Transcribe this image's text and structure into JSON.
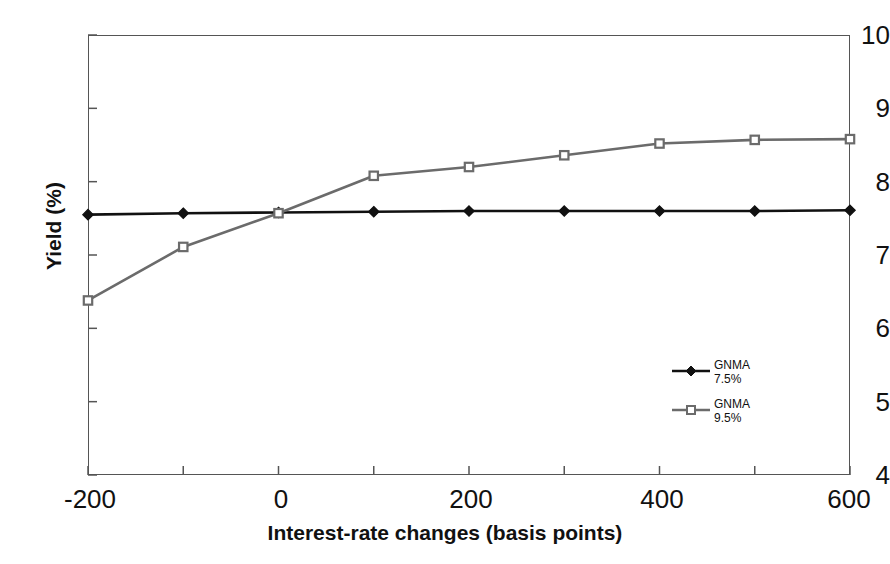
{
  "chart_data": {
    "type": "line",
    "title": "",
    "xlabel": "Interest-rate changes (basis points)",
    "ylabel": "Yield (%)",
    "x": [
      -200,
      -100,
      0,
      100,
      200,
      300,
      400,
      500,
      600
    ],
    "xlim": [
      -200,
      600
    ],
    "ylim": [
      4,
      10
    ],
    "xticks": [
      -200,
      -100,
      0,
      100,
      200,
      300,
      400,
      500,
      600
    ],
    "xtick_labels": [
      "-200",
      "",
      "0",
      "",
      "200",
      "",
      "400",
      "",
      "600"
    ],
    "yticks": [
      4,
      5,
      6,
      7,
      8,
      9,
      10
    ],
    "ytick_labels": [
      "4",
      "5",
      "6",
      "7",
      "8",
      "9",
      "10"
    ],
    "grid": false,
    "legend_position": "inside-right",
    "series": [
      {
        "name": "GNMA\n7.5%",
        "label_line1": "GNMA",
        "label_line2": "7.5%",
        "color": "#111111",
        "marker": "diamond",
        "values": [
          7.55,
          7.57,
          7.58,
          7.59,
          7.6,
          7.6,
          7.6,
          7.6,
          7.61
        ]
      },
      {
        "name": "GNMA\n9.5%",
        "label_line1": "GNMA",
        "label_line2": "9.5%",
        "color": "#6b6b6b",
        "marker": "square",
        "values": [
          6.38,
          7.11,
          7.57,
          8.08,
          8.2,
          8.36,
          8.52,
          8.57,
          8.58
        ]
      }
    ]
  },
  "axes": {
    "y_title": "Yield (%)",
    "x_title": "Interest-rate changes (basis points)",
    "y_labels": [
      "10",
      "9",
      "8",
      "7",
      "6",
      "5",
      "4"
    ],
    "x_labels": [
      "-200",
      "0",
      "200",
      "400",
      "600"
    ]
  },
  "legend": {
    "entries": [
      {
        "line1": "GNMA",
        "line2": "7.5%",
        "color": "#111111",
        "marker": "diamond"
      },
      {
        "line1": "GNMA",
        "line2": "9.5%",
        "color": "#6b6b6b",
        "marker": "square"
      }
    ]
  },
  "colors": {
    "series_1": "#111111",
    "series_2": "#6b6b6b",
    "frame": "#555555",
    "background": "#ffffff"
  }
}
